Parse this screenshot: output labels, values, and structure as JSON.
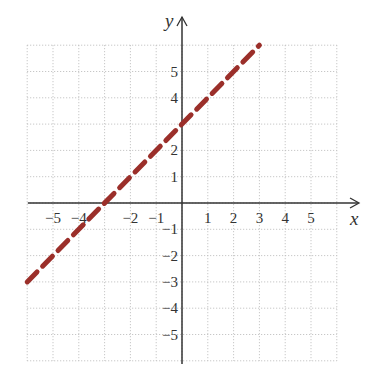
{
  "chart_data": {
    "type": "line",
    "title": "",
    "xlabel": "x",
    "ylabel": "y",
    "xlim": [
      -6,
      6
    ],
    "ylim": [
      -6,
      6
    ],
    "grid": true,
    "grid_style": "dotted",
    "x_ticks": [
      -5,
      -4,
      -2,
      -1,
      1,
      2,
      3,
      4,
      5
    ],
    "x_tick_labels": [
      "−5",
      "−4",
      "−2",
      "−1",
      "1",
      "2",
      "3",
      "4",
      "5"
    ],
    "y_ticks": [
      5,
      4,
      2,
      1,
      -1,
      -2,
      -3,
      -4,
      -5
    ],
    "y_tick_labels": [
      "5",
      "4",
      "2",
      "1",
      "−1",
      "−2",
      "−3",
      "−4",
      "−5"
    ],
    "series": [
      {
        "name": "y = x + 3",
        "style": "dashed",
        "color": "#9b2f2a",
        "x": [
          -6,
          3
        ],
        "y": [
          -3,
          6
        ]
      }
    ],
    "legend": null
  },
  "colors": {
    "line": "#9b2f2a",
    "axis": "#333333",
    "grid": "#bbbbbb"
  }
}
